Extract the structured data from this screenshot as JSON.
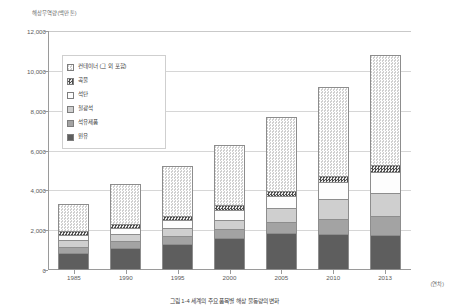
{
  "chart_data": {
    "type": "bar",
    "title": "",
    "ylabel": "해상무역량(백만톤)",
    "xlabel": "(연차)",
    "ylim": [
      0,
      12000
    ],
    "ytick_labels": [
      "12,000",
      "10,000",
      "8,000",
      "6,000",
      "4,000",
      "2,000",
      "0"
    ],
    "ytick_values": [
      12000,
      10000,
      8000,
      6000,
      4000,
      2000,
      0
    ],
    "grid": true,
    "stacked": true,
    "legend_position": "inside-top-left",
    "categories": [
      "1985",
      "1990",
      "1995",
      "2000",
      "2005",
      "2010",
      "2013"
    ],
    "series": [
      {
        "name": "원유",
        "key": "crude",
        "values": [
          870,
          1110,
          1300,
          1600,
          1860,
          1790,
          1760
        ]
      },
      {
        "name": "석유제품",
        "key": "petro",
        "values": [
          300,
          330,
          390,
          460,
          570,
          790,
          940
        ]
      },
      {
        "name": "철광석",
        "key": "iron",
        "values": [
          320,
          350,
          400,
          450,
          660,
          990,
          1180
        ]
      },
      {
        "name": "석탄",
        "key": "coal",
        "values": [
          270,
          340,
          420,
          510,
          620,
          840,
          1050
        ]
      },
      {
        "name": "곡물",
        "key": "grain",
        "values": [
          180,
          190,
          200,
          230,
          250,
          290,
          330
        ]
      },
      {
        "name": "컨테이너 (그 외 포함)",
        "key": "cont",
        "values": [
          1360,
          1980,
          2490,
          3050,
          3740,
          4500,
          5540
        ]
      }
    ],
    "totals": [
      3300,
      4300,
      5200,
      6300,
      7700,
      9200,
      10800
    ],
    "caption": "그림 1-4 세계의 주요 품목별 해상 물동량의 변화"
  }
}
